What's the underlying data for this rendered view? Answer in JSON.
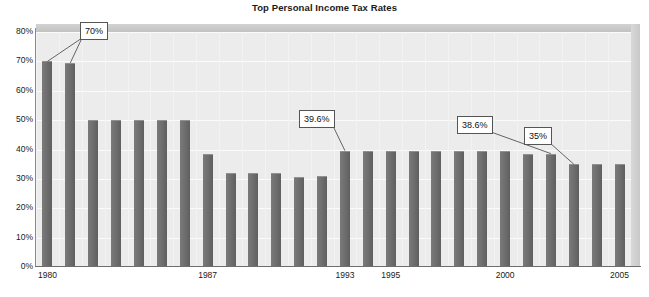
{
  "chart_data": {
    "type": "bar",
    "title": "Top Personal Income Tax Rates",
    "xlabel": "",
    "ylabel": "",
    "ylim": [
      0,
      80
    ],
    "grid": true,
    "legend": "none",
    "ytick_labels": [
      "80%",
      "70%",
      "60%",
      "50%",
      "40%",
      "30%",
      "20%",
      "10%",
      "0%"
    ],
    "ytick_values": [
      80,
      70,
      60,
      50,
      40,
      30,
      20,
      10,
      0
    ],
    "xtick_labels": [
      "1980",
      "1987",
      "1993",
      "1995",
      "2000",
      "2005"
    ],
    "xtick_years": [
      1980,
      1987,
      1993,
      1995,
      2000,
      2005
    ],
    "categories": [
      "1980",
      "1981",
      "1982",
      "1983",
      "1984",
      "1985",
      "1986",
      "1987",
      "1988",
      "1989",
      "1990",
      "1991",
      "1992",
      "1993",
      "1994",
      "1995",
      "1996",
      "1997",
      "1998",
      "1999",
      "2000",
      "2001",
      "2002",
      "2003",
      "2004",
      "2005"
    ],
    "values": [
      70,
      69.5,
      50,
      50,
      50,
      50,
      50,
      38.5,
      31.9,
      31.9,
      31.9,
      30.8,
      30.9,
      39.6,
      39.6,
      39.6,
      39.6,
      39.6,
      39.6,
      39.6,
      39.6,
      38.6,
      38.6,
      35,
      35,
      35
    ],
    "annotations": [
      {
        "label": "70%",
        "value": 70,
        "points_to": [
          "1980",
          "1981"
        ]
      },
      {
        "label": "39.6%",
        "value": 39.6,
        "points_to": [
          "1993"
        ]
      },
      {
        "label": "38.6%",
        "value": 38.6,
        "points_to": [
          "2002"
        ]
      },
      {
        "label": "35%",
        "value": 35,
        "points_to": [
          "2003"
        ]
      }
    ],
    "colors": {
      "bar": "#6f6f6f",
      "plot_background": "#ececec",
      "gridline": "#fbfbfb",
      "axis": "#6d6d6d",
      "text": "#1a1a1a",
      "callout_border": "#555555",
      "callout_fill": "#ffffff",
      "shell_top": "#c9c9c9",
      "shell_right": "#d0d0d0"
    }
  }
}
